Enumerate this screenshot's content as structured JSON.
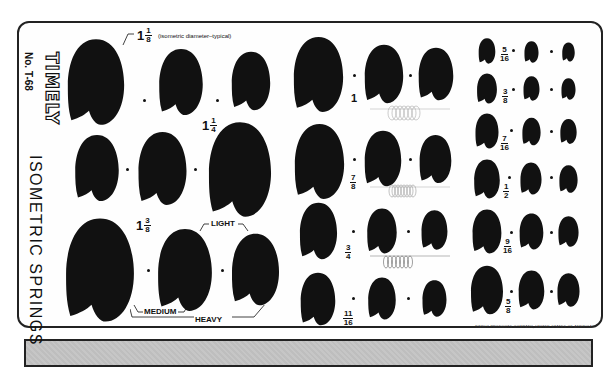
{
  "template": {
    "brand": "TIMELY",
    "model_number": "No. T-68",
    "title": "ISOMETRIC SPRINGS",
    "footer": "TIMELY PRODUCTS COMPANY, UNITED STATES OF AMERICA",
    "colors": {
      "shape_fill": "#111111",
      "body": "#fefefe",
      "ledge": "#c4c4c4",
      "outline": "#222222"
    }
  },
  "annotations": {
    "typical_note": "(isometric diameter–typical)",
    "light": "LIGHT",
    "medium": "MEDIUM",
    "heavy": "HEAVY"
  },
  "sizes": {
    "s1_1_8": {
      "whole": "1",
      "num": "1",
      "den": "8"
    },
    "s1_1_4": {
      "whole": "1",
      "num": "1",
      "den": "4"
    },
    "s1_3_8": {
      "whole": "1",
      "num": "3",
      "den": "8"
    },
    "s1": {
      "whole": "1"
    },
    "s7_8": {
      "num": "7",
      "den": "8"
    },
    "s3_4": {
      "num": "3",
      "den": "4"
    },
    "s11_16": {
      "num": "11",
      "den": "16"
    },
    "s5_16": {
      "num": "5",
      "den": "16"
    },
    "s3_8": {
      "num": "3",
      "den": "8"
    },
    "s7_16": {
      "num": "7",
      "den": "16"
    },
    "s1_2": {
      "num": "1",
      "den": "2"
    },
    "s9_16": {
      "num": "9",
      "den": "16"
    },
    "s5_8": {
      "num": "5",
      "den": "8"
    }
  }
}
